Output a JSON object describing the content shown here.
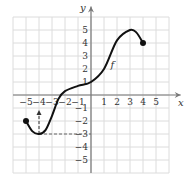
{
  "chart_data": {
    "type": "line",
    "title": "",
    "xlabel": "x",
    "ylabel": "y",
    "function_label": "f",
    "xlim": [
      -6,
      6
    ],
    "ylim": [
      -6,
      6
    ],
    "grid": true,
    "xticks": [
      -5,
      -4,
      -3,
      -2,
      -1,
      1,
      2,
      3,
      4,
      5
    ],
    "yticks": [
      -5,
      -4,
      -3,
      -2,
      -1,
      1,
      2,
      3,
      4,
      5
    ],
    "series": [
      {
        "name": "f",
        "x": [
          -5,
          -4.5,
          -4,
          -3.5,
          -3,
          -2.5,
          -2,
          -1,
          0,
          1,
          2,
          3,
          3.5,
          4
        ],
        "y": [
          -2,
          -2.8,
          -3,
          -2.7,
          -1.6,
          -0.3,
          0.3,
          0.7,
          1,
          2,
          4.2,
          5,
          4.8,
          4
        ]
      }
    ],
    "endpoints": [
      {
        "x": -5,
        "y": -2,
        "closed": true
      },
      {
        "x": 4,
        "y": 4,
        "closed": true
      }
    ],
    "annotations": [
      {
        "type": "dashed-arrow",
        "from": [
          -4,
          -3
        ],
        "to": [
          -4,
          -1.3
        ],
        "direction": "up"
      },
      {
        "type": "dashed-line",
        "from": [
          -4,
          -3
        ],
        "to": [
          0,
          -3
        ]
      }
    ]
  },
  "labels": {
    "x_axis": "x",
    "y_axis": "y",
    "function": "f"
  }
}
